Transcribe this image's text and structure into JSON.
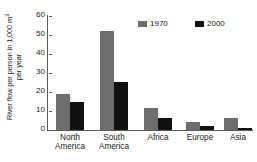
{
  "chart_data": {
    "type": "bar",
    "title": "",
    "xlabel": "",
    "ylabel": "River flow per person in 1,000 m³ per year",
    "ylabel_line1": "River flow per person in 1,000 m",
    "ylabel_sup": "3",
    "ylabel_line2": "per year",
    "categories": [
      "North America",
      "South America",
      "Africa",
      "Europe",
      "Asia"
    ],
    "categories_wrapped": [
      [
        "North",
        "America"
      ],
      [
        "South",
        "America"
      ],
      [
        "Africa",
        ""
      ],
      [
        "Europe",
        ""
      ],
      [
        "Asia",
        ""
      ]
    ],
    "series": [
      {
        "name": "1970",
        "color": "#6e6e6e",
        "values": [
          18.8,
          52.2,
          11.4,
          4.2,
          6.1
        ]
      },
      {
        "name": "2000",
        "color": "#111111",
        "values": [
          14.9,
          25.5,
          6.4,
          2.1,
          1.2
        ]
      }
    ],
    "ylim": [
      0,
      60
    ],
    "yticks": [
      0,
      10,
      20,
      30,
      40,
      50,
      60
    ],
    "ytick_labels": [
      "0",
      "10",
      "20",
      "30",
      "40",
      "50",
      "60"
    ],
    "grid": false,
    "legend_position": "top-right",
    "legend_entries": [
      "1970",
      "2000"
    ]
  }
}
